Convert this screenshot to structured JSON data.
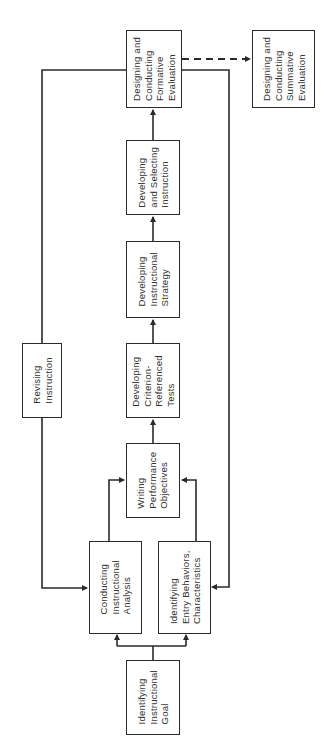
{
  "diagram": {
    "orientation": "rotated -90deg (reads bottom-to-top)",
    "colors": {
      "line": "#2a2a2a",
      "text": "#333333",
      "background": "#ffffff"
    },
    "nodes": {
      "goal": {
        "label": "Identifying\nInstructional\nGoal"
      },
      "analysis": {
        "label": "Conducting\nInstructional\nAnalysis"
      },
      "entry": {
        "label": "Identifying\nEntry Behaviors,\nCharacteristics"
      },
      "objectives": {
        "label": "Writing\nPerformance\nObjectives"
      },
      "tests": {
        "label": "Developing\nCriterion-\nReferenced\nTests"
      },
      "strategy": {
        "label": "Developing\nInstructional\nStrategy"
      },
      "selecting": {
        "label": "Developing\nand Selecting\nInstruction"
      },
      "formative": {
        "label": "Designing and\nConducting\nFormative\nEvaluation"
      },
      "summative": {
        "label": "Designing and\nConducting\nSummative\nEvaluation"
      },
      "revising": {
        "label": "Revising\nInstruction"
      }
    },
    "edges": [
      {
        "from": "goal",
        "to": "analysis",
        "style": "solid"
      },
      {
        "from": "goal",
        "to": "entry",
        "style": "solid"
      },
      {
        "from": "analysis",
        "to": "objectives",
        "style": "solid"
      },
      {
        "from": "entry",
        "to": "objectives",
        "style": "solid"
      },
      {
        "from": "objectives",
        "to": "tests",
        "style": "solid"
      },
      {
        "from": "tests",
        "to": "strategy",
        "style": "solid"
      },
      {
        "from": "strategy",
        "to": "selecting",
        "style": "solid"
      },
      {
        "from": "selecting",
        "to": "formative",
        "style": "solid"
      },
      {
        "from": "formative",
        "to": "summative",
        "style": "dashed"
      },
      {
        "from": "formative",
        "to": "revising",
        "style": "solid",
        "note": "feedback loop"
      },
      {
        "from": "revising",
        "to": "analysis",
        "style": "solid"
      },
      {
        "from": "formative",
        "to": "entry",
        "style": "solid",
        "note": "feedback loop"
      }
    ]
  }
}
